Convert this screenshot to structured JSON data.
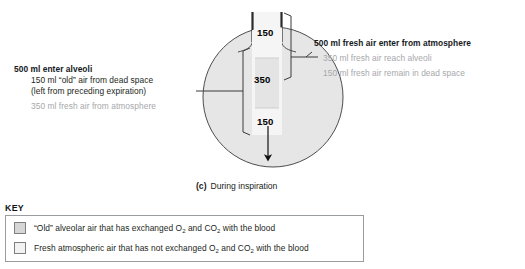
{
  "figure": {
    "caption_label": "(c)",
    "caption_text": "During inspiration",
    "volumes": {
      "top": "150",
      "middle": "350",
      "bottom": "150"
    }
  },
  "left_annotation": {
    "line1": "500 ml enter alveoli",
    "line2": "150 ml “old” air from dead space",
    "line3": "(left from preceding expiration)",
    "line4": "350 ml fresh air from atmosphere"
  },
  "right_annotation": {
    "line1": "500 ml fresh air enter from atmosphere",
    "line2": "350 ml fresh air reach alveoli",
    "line3": "150 ml fresh air remain in dead space"
  },
  "key": {
    "heading": "KEY",
    "items": [
      {
        "swatch_color": "#d6d6d6",
        "text_pre": "“Old” alveolar air that has exchanged O",
        "sub1": "2",
        "text_mid": " and CO",
        "sub2": "2",
        "text_post": " with the blood"
      },
      {
        "swatch_color": "#f2f2f2",
        "text_pre": "Fresh atmospheric air that has not exchanged O",
        "sub1": "2",
        "text_mid": " and CO",
        "sub2": "2",
        "text_post": " with the blood"
      }
    ]
  },
  "colors": {
    "alveoli_fill": "#e6e6e6",
    "alveoli_stroke": "#4d4d4d",
    "tube_fresh_fill": "#f5f5f5",
    "tube_old_fill": "#dedede",
    "tube_edge_dark": "#2b2b2b",
    "leader_line": "#3a3a3a",
    "gray_text": "#a6a8ab"
  }
}
